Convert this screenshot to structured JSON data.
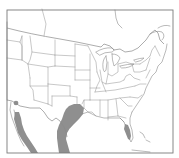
{
  "map": {
    "subject": "Species range map",
    "region": "United States, southern Canada and northern Mexico",
    "colors": {
      "background": "#ffffff",
      "borders": "#9a9a9a",
      "frame": "#7a7a7a",
      "range_fill": "#8f8f8f"
    },
    "range_areas": [
      {
        "name": "South Texas and northeastern Mexico Gulf coast"
      },
      {
        "name": "Sonora / Gulf of California coastal strip"
      },
      {
        "name": "Southern Arizona isolated patch"
      },
      {
        "name": "South-central Florida"
      }
    ]
  }
}
